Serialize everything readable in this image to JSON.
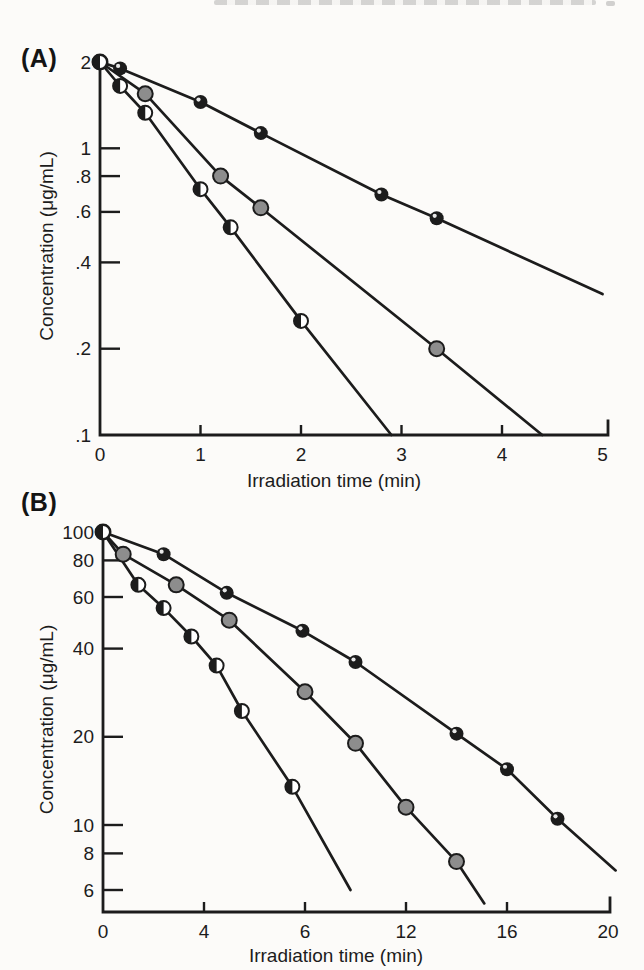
{
  "figure": {
    "panel_a_label": "(A)",
    "panel_b_label": "(B)"
  },
  "colors": {
    "ink": "#1c1c1c",
    "gray_marker": "#8d8d8d",
    "paper": "#fcfbf9"
  },
  "chart_data": [
    {
      "id": "A",
      "type": "line",
      "scale": "semilog-y",
      "panel_label": "(A)",
      "xlabel": "Irradiation time (min)",
      "ylabel": "Concentration (μg/mL)",
      "xlim": [
        0,
        5
      ],
      "ylim": [
        0.1,
        2
      ],
      "grid": false,
      "legend": "none",
      "xticks": [
        {
          "v": 0,
          "label": "0"
        },
        {
          "v": 1,
          "label": "1"
        },
        {
          "v": 2,
          "label": "2"
        },
        {
          "v": 3,
          "label": "3"
        },
        {
          "v": 4,
          "label": "4"
        },
        {
          "v": 5,
          "label": "5"
        }
      ],
      "yticks": [
        {
          "v": 2,
          "label": "2"
        },
        {
          "v": 1,
          "label": "1"
        },
        {
          "v": 0.8,
          "label": ".8"
        },
        {
          "v": 0.6,
          "label": ".6"
        },
        {
          "v": 0.4,
          "label": ".4"
        },
        {
          "v": 0.2,
          "label": ".2"
        },
        {
          "v": 0.1,
          "label": ".1"
        }
      ],
      "series": [
        {
          "name": "black-filled-circles",
          "marker": "black",
          "points": [
            [
              0,
              2.0
            ],
            [
              0.2,
              1.9
            ],
            [
              1.0,
              1.45
            ],
            [
              1.6,
              1.13
            ],
            [
              2.8,
              0.69
            ],
            [
              3.35,
              0.57
            ]
          ],
          "line_extends_to": [
            5.0,
            0.31
          ]
        },
        {
          "name": "gray-filled-circles",
          "marker": "gray",
          "points": [
            [
              0,
              2.0
            ],
            [
              0.45,
              1.55
            ],
            [
              1.2,
              0.8
            ],
            [
              1.6,
              0.62
            ],
            [
              3.35,
              0.2
            ]
          ],
          "line_extends_to": [
            4.4,
            0.1
          ]
        },
        {
          "name": "half-filled-circles",
          "marker": "half",
          "points": [
            [
              0,
              2.0
            ],
            [
              0.2,
              1.65
            ],
            [
              0.45,
              1.33
            ],
            [
              1.0,
              0.72
            ],
            [
              1.3,
              0.53
            ],
            [
              2.0,
              0.25
            ]
          ],
          "line_extends_to": [
            2.9,
            0.1
          ]
        }
      ]
    },
    {
      "id": "B",
      "type": "line",
      "scale": "semilog-y",
      "panel_label": "(B)",
      "xlabel": "Irradiation time (min)",
      "ylabel": "Concentration (μg/mL)",
      "xlim": [
        0,
        20
      ],
      "ylim": [
        5,
        100
      ],
      "grid": false,
      "legend": "none",
      "xticks": [
        {
          "v": 0,
          "label": "0"
        },
        {
          "v": 4,
          "label": "4"
        },
        {
          "v": 8,
          "label": "6"
        },
        {
          "v": 12,
          "label": "12"
        },
        {
          "v": 16,
          "label": "16"
        },
        {
          "v": 20,
          "label": "20"
        }
      ],
      "yticks": [
        {
          "v": 100,
          "label": "100"
        },
        {
          "v": 80,
          "label": "80"
        },
        {
          "v": 60,
          "label": "60"
        },
        {
          "v": 40,
          "label": "40"
        },
        {
          "v": 20,
          "label": "20"
        },
        {
          "v": 10,
          "label": "10"
        },
        {
          "v": 8,
          "label": "8"
        },
        {
          "v": 6,
          "label": "6"
        }
      ],
      "series": [
        {
          "name": "black-filled-circles",
          "marker": "black",
          "points": [
            [
              0,
              100
            ],
            [
              2.4,
              84
            ],
            [
              4.9,
              62
            ],
            [
              7.9,
              46
            ],
            [
              10,
              36
            ],
            [
              14,
              20.5
            ],
            [
              16,
              15.5
            ],
            [
              18,
              10.5
            ]
          ],
          "line_extends_to": [
            20.3,
            7
          ]
        },
        {
          "name": "gray-filled-circles",
          "marker": "gray",
          "points": [
            [
              0,
              100
            ],
            [
              0.8,
              84
            ],
            [
              2.9,
              66
            ],
            [
              5,
              50
            ],
            [
              8,
              28.5
            ],
            [
              10,
              19
            ],
            [
              12,
              11.5
            ],
            [
              14,
              7.5
            ]
          ],
          "line_extends_to": [
            15.1,
            5.4
          ]
        },
        {
          "name": "half-filled-circles",
          "marker": "half",
          "points": [
            [
              0,
              100
            ],
            [
              1.4,
              66
            ],
            [
              2.4,
              55
            ],
            [
              3.5,
              44
            ],
            [
              4.5,
              35
            ],
            [
              5.5,
              24.5
            ],
            [
              7.5,
              13.5
            ]
          ],
          "line_extends_to": [
            9.8,
            6
          ]
        }
      ]
    }
  ]
}
